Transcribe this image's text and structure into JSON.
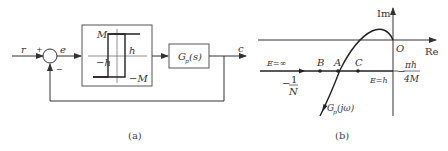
{
  "figure_a": {
    "caption": "(a)",
    "input_label": "r",
    "plus_sign": "+",
    "minus_sign": "−",
    "error_label": "e",
    "nonlinearity": {
      "M_label": "M",
      "negM_label": "−M",
      "h_label": "h",
      "negh_label": "−h"
    },
    "plant_label_main": "G",
    "plant_label_sub": "p",
    "plant_label_arg": "(s)",
    "output_label": "c"
  },
  "figure_b": {
    "caption": "(b)",
    "im_axis_label": "Im",
    "re_axis_label": "Re",
    "origin_label": "O",
    "e_inf_label": "E=∞",
    "e_h_label": "E=h",
    "point_b": "B",
    "point_a": "A",
    "point_c": "C",
    "neg_inv_n_num": "1",
    "neg_inv_n_den": "N",
    "neg_inv_n_sign": "−",
    "right_frac_num": "πh",
    "right_frac_den": "4M",
    "right_frac_sign": "−",
    "curve_label_main": "G",
    "curve_label_sub": "p",
    "curve_label_arg": "(jω)"
  },
  "colors": {
    "line": "#333333",
    "box_border": "#555555"
  }
}
